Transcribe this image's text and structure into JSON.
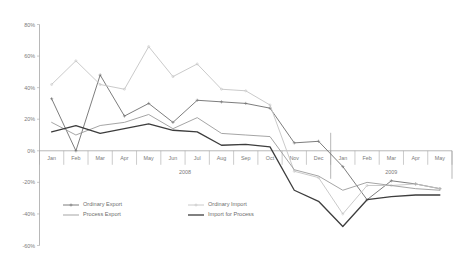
{
  "chart_data": {
    "type": "line",
    "title": "",
    "subtitle": "",
    "xlabel": "",
    "ylabel": "",
    "ylim": [
      -60,
      80
    ],
    "yticks": [
      80,
      60,
      40,
      20,
      0,
      -20,
      -40,
      -60
    ],
    "ytick_labels": [
      "80%",
      "60%",
      "40%",
      "20%",
      "0%",
      "-20%",
      "-40%",
      "-60%"
    ],
    "grid": false,
    "legend_position": "bottom-left",
    "categories": [
      "Jan",
      "Feb",
      "Mar",
      "Apr",
      "May",
      "Jun",
      "Jul",
      "Aug",
      "Sep",
      "Oct",
      "Nov",
      "Dec",
      "Jan",
      "Feb",
      "Mar",
      "Apr",
      "May"
    ],
    "group_labels": [
      {
        "label": "2008",
        "start": 0,
        "end": 11
      },
      {
        "label": "2009",
        "start": 12,
        "end": 16
      }
    ],
    "series": [
      {
        "name": "Ordinary Export",
        "color": "#6e6e6e",
        "width": 0.9,
        "marker": "cross",
        "values": [
          33,
          0,
          48,
          22,
          30,
          18,
          32,
          31,
          30,
          27,
          5,
          6,
          -10,
          -31,
          -19,
          -21,
          -24
        ]
      },
      {
        "name": "Ordinary Import",
        "color": "#c4c4c4",
        "width": 0.9,
        "marker": "dot",
        "values": [
          42,
          57,
          42,
          39,
          66,
          47,
          55,
          39,
          38,
          29,
          -13,
          -17,
          -40,
          -22,
          -22,
          -21,
          -24
        ]
      },
      {
        "name": "Process Export",
        "color": "#9b9b9b",
        "width": 0.9,
        "marker": "none",
        "values": [
          18,
          10,
          16,
          18,
          23,
          14,
          21,
          11,
          10,
          9,
          -12,
          -16,
          -25,
          -20,
          -22,
          -24,
          -25
        ]
      },
      {
        "name": "Import for Process",
        "color": "#3d3d3d",
        "width": 1.3,
        "marker": "none",
        "values": [
          12,
          16,
          11,
          14,
          17,
          13,
          12,
          3.5,
          4,
          2.5,
          -25,
          -32,
          -48,
          -31,
          -29,
          -28,
          -28
        ]
      }
    ]
  },
  "legend": {
    "entries": [
      {
        "label": "Ordinary Export",
        "color": "#6e6e6e",
        "marker": "cross",
        "width": 0.9
      },
      {
        "label": "Ordinary Import",
        "color": "#c4c4c4",
        "marker": "dot",
        "width": 0.9
      },
      {
        "label": "Process Export",
        "color": "#9b9b9b",
        "marker": "none",
        "width": 0.9
      },
      {
        "label": "Import for Process",
        "color": "#3d3d3d",
        "marker": "none",
        "width": 1.3
      }
    ]
  }
}
